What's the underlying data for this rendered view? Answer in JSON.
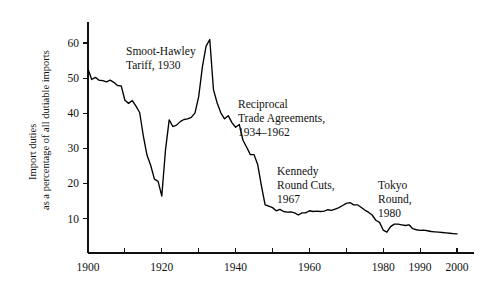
{
  "chart_data": {
    "type": "line",
    "title": "",
    "xlabel": "",
    "ylabel_line1": "Import duties",
    "ylabel_line2": "as a percentage of all dutiable imports",
    "xlim": [
      1900,
      2002
    ],
    "ylim": [
      0,
      66
    ],
    "grid": false,
    "legend": "none",
    "x_tick_values": [
      1900,
      1910,
      1920,
      1930,
      1940,
      1950,
      1960,
      1970,
      1980,
      1990,
      2000
    ],
    "x_tick_labels": [
      "1900",
      "",
      "1920",
      "",
      "1940",
      "",
      "1960",
      "",
      "1980",
      "1990",
      "2000"
    ],
    "y_tick_values": [
      10,
      20,
      30,
      40,
      50,
      60
    ],
    "y_tick_labels": [
      "10",
      "20",
      "30",
      "40",
      "50",
      "60"
    ],
    "series": [
      {
        "name": "Average tariff rate on dutiable imports",
        "x": [
          1900,
          1901,
          1902,
          1903,
          1904,
          1905,
          1906,
          1907,
          1908,
          1909,
          1910,
          1911,
          1912,
          1913,
          1914,
          1915,
          1916,
          1917,
          1918,
          1919,
          1920,
          1921,
          1922,
          1923,
          1924,
          1925,
          1926,
          1927,
          1928,
          1929,
          1930,
          1931,
          1932,
          1933,
          1934,
          1935,
          1936,
          1937,
          1938,
          1939,
          1940,
          1941,
          1942,
          1943,
          1944,
          1945,
          1946,
          1947,
          1948,
          1949,
          1950,
          1951,
          1952,
          1953,
          1954,
          1955,
          1956,
          1957,
          1958,
          1959,
          1960,
          1961,
          1962,
          1963,
          1964,
          1965,
          1966,
          1967,
          1968,
          1969,
          1970,
          1971,
          1972,
          1973,
          1974,
          1975,
          1976,
          1977,
          1978,
          1979,
          1980,
          1981,
          1982,
          1983,
          1984,
          1985,
          1986,
          1987,
          1988,
          1989,
          1990,
          1991,
          1992,
          1993,
          1994,
          1995,
          1996,
          1997,
          1998,
          1999,
          2000
        ],
        "y": [
          52.6,
          49.6,
          50.2,
          49.4,
          49.3,
          48.9,
          49.4,
          48.8,
          47.9,
          47.8,
          43.7,
          42.8,
          43.6,
          42.0,
          40.2,
          33.5,
          28.0,
          25.1,
          21.2,
          20.6,
          16.4,
          29.5,
          38.1,
          36.2,
          36.6,
          37.6,
          38.2,
          38.4,
          38.8,
          40.1,
          44.7,
          53.2,
          59.1,
          61.0,
          46.7,
          42.9,
          40.1,
          38.4,
          39.3,
          37.3,
          36.0,
          36.8,
          32.3,
          30.3,
          28.2,
          28.2,
          25.3,
          19.3,
          13.9,
          13.5,
          13.1,
          12.2,
          12.6,
          12.0,
          11.8,
          11.9,
          11.6,
          11.0,
          11.6,
          11.6,
          12.2,
          12.0,
          12.1,
          12.0,
          12.1,
          12.5,
          12.3,
          12.7,
          13.1,
          13.7,
          14.3,
          14.5,
          13.9,
          13.9,
          13.2,
          12.4,
          11.8,
          11.0,
          9.5,
          8.9,
          6.7,
          6.1,
          7.7,
          8.4,
          8.4,
          8.2,
          8.0,
          8.2,
          7.1,
          6.8,
          6.6,
          6.7,
          6.5,
          6.3,
          6.2,
          6.1,
          6.0,
          5.9,
          5.8,
          5.7,
          5.6
        ]
      }
    ],
    "annotations": [
      {
        "id": "smoot-hawley",
        "lines": [
          "Smoot-Hawley",
          "Tariff, 1930"
        ],
        "x_px": 126,
        "y_px": 55
      },
      {
        "id": "reciprocal-trade",
        "lines": [
          "Reciprocal",
          "Trade Agreements,",
          "1934–1962"
        ],
        "x_px": 238,
        "y_px": 108
      },
      {
        "id": "kennedy-round",
        "lines": [
          "Kennedy",
          "Round Cuts,",
          "1967"
        ],
        "x_px": 277,
        "y_px": 175
      },
      {
        "id": "tokyo-round",
        "lines": [
          "Tokyo",
          "Round,",
          "1980"
        ],
        "x_px": 378,
        "y_px": 189
      }
    ]
  }
}
